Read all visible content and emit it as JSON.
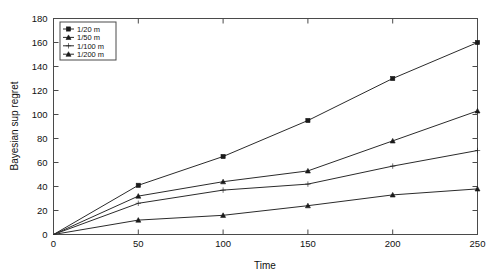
{
  "chart_data": {
    "type": "line",
    "title": "",
    "xlabel": "Time",
    "ylabel": "Bayesian sup regret",
    "x": [
      0,
      50,
      100,
      150,
      200,
      250
    ],
    "xlim": [
      0,
      250
    ],
    "ylim": [
      0,
      180
    ],
    "xticks": [
      0,
      50,
      100,
      150,
      200,
      250
    ],
    "yticks": [
      0,
      20,
      40,
      60,
      80,
      100,
      120,
      140,
      160,
      180
    ],
    "xticklabels": [
      "0",
      "50",
      "100",
      "150",
      "200",
      "250"
    ],
    "yticklabels": [
      "0",
      "20",
      "40",
      "60",
      "80",
      "100",
      "120",
      "140",
      "160",
      "180"
    ],
    "grid": false,
    "legend_position": "upper left",
    "series": [
      {
        "name": "1/20 m",
        "marker": "square",
        "values": [
          0,
          41,
          65,
          95,
          130,
          160
        ]
      },
      {
        "name": "1/50 m",
        "marker": "triangle",
        "values": [
          0,
          32,
          44,
          53,
          78,
          103
        ]
      },
      {
        "name": "1/100 m",
        "marker": "plus",
        "values": [
          0,
          26,
          37,
          42,
          57,
          70
        ]
      },
      {
        "name": "1/200 m",
        "marker": "triangle",
        "values": [
          0,
          12,
          16,
          24,
          33,
          38
        ]
      }
    ]
  },
  "legend": {
    "items": [
      "1/20 m",
      "1/50 m",
      "1/100 m",
      "1/200 m"
    ]
  }
}
